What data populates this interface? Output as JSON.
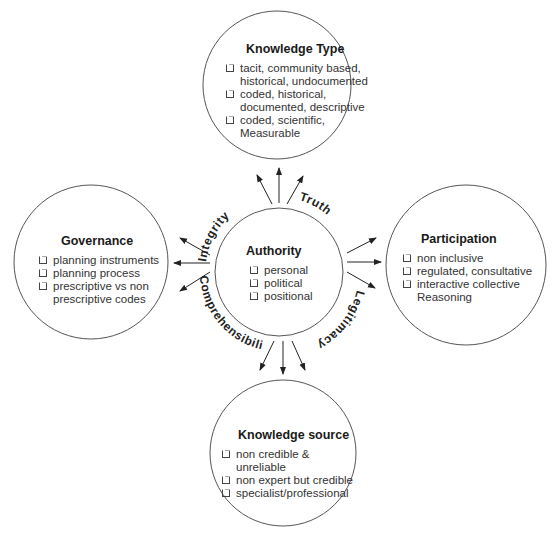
{
  "center": {
    "title": "Authority",
    "items": [
      "personal",
      "political",
      "positional"
    ]
  },
  "nodes": {
    "top": {
      "title": "Knowledge Type",
      "items": [
        "tacit, community based, historical, undocumented",
        "coded, historical, documented, descriptive",
        "coded, scientific, Measurable"
      ]
    },
    "left": {
      "title": "Governance",
      "items": [
        "planning instruments",
        "planning process",
        "prescriptive vs non prescriptive codes"
      ]
    },
    "right": {
      "title": "Participation",
      "items": [
        "non inclusive",
        "regulated, consultative",
        "interactive collective Reasoning"
      ]
    },
    "bottom": {
      "title": "Knowledge source",
      "items": [
        "non credible & unreliable",
        "non expert but credible",
        "specialist/professional"
      ]
    }
  },
  "ring_labels": {
    "top_left": "Integrity",
    "top_right": "Truth",
    "bottom_right": "Legitimacy",
    "bottom_left": "Comprehensibility"
  }
}
